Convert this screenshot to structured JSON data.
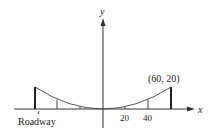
{
  "diagram": {
    "axes": {
      "x_label": "x",
      "y_label": "y"
    },
    "x_ticks": [
      "20",
      "40"
    ],
    "point_label": "(60, 20)",
    "roadway_label": "Roadway",
    "curve": {
      "type": "parabola",
      "equation_form": "y = a x^2",
      "vertex": [
        0,
        0
      ],
      "endpoints": [
        [
          -60,
          20
        ],
        [
          60,
          20
        ]
      ]
    },
    "cables_at_x": [
      -60,
      -40,
      -20,
      20,
      40,
      60
    ]
  }
}
